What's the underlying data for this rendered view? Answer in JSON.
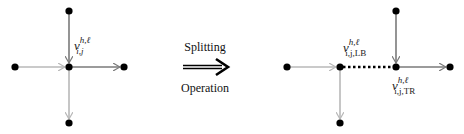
{
  "diagram": {
    "left": {
      "vertex_label": {
        "base": "v",
        "sup": "h,ℓ",
        "sub": "i,j"
      },
      "colors": {
        "incoming_top": "#7a7a7a",
        "incoming_left": "#b8b8b8",
        "outgoing_right": "#7a7a7a",
        "outgoing_bottom": "#b8b8b8"
      }
    },
    "operation": {
      "top_label": "Splitting",
      "bottom_label": "Operation",
      "arrow": "double-arrow-right"
    },
    "right": {
      "vertex_lb_label": {
        "base": "v",
        "sup": "h,ℓ",
        "sub": "i,j,LB"
      },
      "vertex_tr_label": {
        "base": "v",
        "sup": "h,ℓ",
        "sub": "i,j,TR"
      },
      "connector": "dotted"
    }
  }
}
